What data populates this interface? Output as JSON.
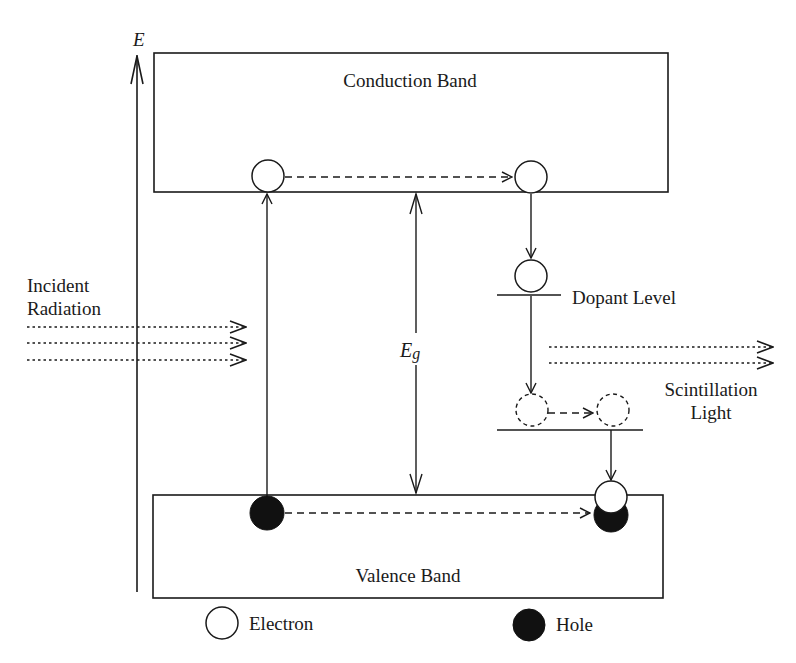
{
  "diagram": {
    "axis_label": "E",
    "bands": {
      "conduction": "Conduction Band",
      "valence": "Valence Band"
    },
    "levels": {
      "dopant": "Dopant Level"
    },
    "gap_label_main": "E",
    "gap_label_sub": "g",
    "incident": {
      "line1": "Incident",
      "line2": "Radiation"
    },
    "emission": {
      "line1": "Scintillation",
      "line2": "Light"
    },
    "legend": {
      "electron": "Electron",
      "hole": "Hole"
    },
    "colors": {
      "stroke": "#1a1a1a",
      "fill_hole": "#111111",
      "background": "#ffffff"
    }
  }
}
